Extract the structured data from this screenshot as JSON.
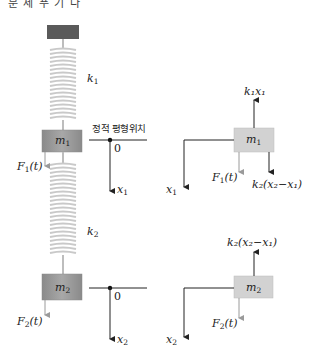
{
  "header_fragment": "문 제 푸 기 다",
  "colors": {
    "ceiling": "#5a5a5a",
    "mass_left": "#9e9e9e",
    "mass_right": "#d2d2d2",
    "spring": "#cfcfcf",
    "force_arrow": "#9a9a9a",
    "axis": "#222222"
  },
  "left_system": {
    "spring_1_label": "k",
    "spring_1_sub": "1",
    "spring_2_label": "k",
    "spring_2_sub": "2",
    "mass_1_label": "m",
    "mass_1_sub": "1",
    "mass_2_label": "m",
    "mass_2_sub": "2",
    "force_1_label": "F",
    "force_1_sub": "1",
    "force_1_arg": "(t)",
    "force_2_label": "F",
    "force_2_sub": "2",
    "force_2_arg": "(t)",
    "equilibrium_label": "정적 평형위치",
    "origin_1": "0",
    "origin_2": "0",
    "axis_1_label": "x",
    "axis_1_sub": "1",
    "axis_2_label": "x",
    "axis_2_sub": "2"
  },
  "free_body_1": {
    "mass_label": "m",
    "mass_sub": "1",
    "up_force": "k₁x₁",
    "force_label": "F",
    "force_sub": "1",
    "force_arg": "(t)",
    "down_force": "k₂(x₂−x₁)",
    "axis_label": "x",
    "axis_sub": "1"
  },
  "free_body_2": {
    "mass_label": "m",
    "mass_sub": "2",
    "up_force": "k₂(x₂−x₁)",
    "force_label": "F",
    "force_sub": "2",
    "force_arg": "(t)",
    "axis_label": "x",
    "axis_sub": "2"
  }
}
